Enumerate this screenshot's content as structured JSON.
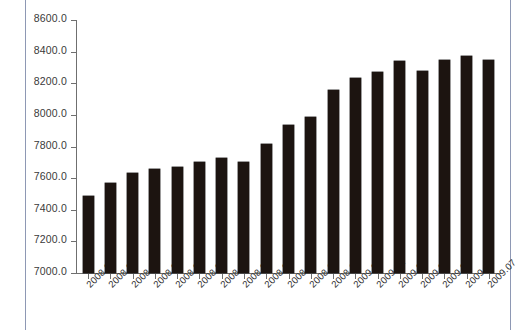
{
  "chart_data": {
    "type": "bar",
    "title": "",
    "subtitle": "",
    "xlabel": "",
    "ylabel": "",
    "categories": [
      "2008.01",
      "2008.02",
      "2008.03",
      "2008.04",
      "2008.05",
      "2008.06",
      "2008.07",
      "2008.08",
      "2008.09",
      "2008.10",
      "2008.11",
      "2008.12",
      "2009.01",
      "2009.02",
      "2009.03",
      "2009.04",
      "2009.05",
      "2009.06",
      "2009.07"
    ],
    "values": [
      7485,
      7570,
      7630,
      7655,
      7670,
      7700,
      7730,
      7700,
      7815,
      7935,
      7985,
      8155,
      8235,
      8270,
      8340,
      8280,
      8345,
      8375,
      8350
    ],
    "ylim": [
      7000,
      8600
    ],
    "ytick_values": [
      7000,
      7200,
      7400,
      7600,
      7800,
      8000,
      8200,
      8400,
      8600
    ],
    "ytick_labels": [
      "7000.0",
      "7200.0",
      "7400.0",
      "7600.0",
      "7800.0",
      "8000.0",
      "8200.0",
      "8400.0",
      "8600.0"
    ],
    "grid": false,
    "legend": null,
    "legend_position": "none",
    "bar_color": "#1c1410",
    "axis_color": "#6f6f6f",
    "background_color": "#ffffff"
  },
  "page": {
    "border_color": "#8e98b4"
  }
}
